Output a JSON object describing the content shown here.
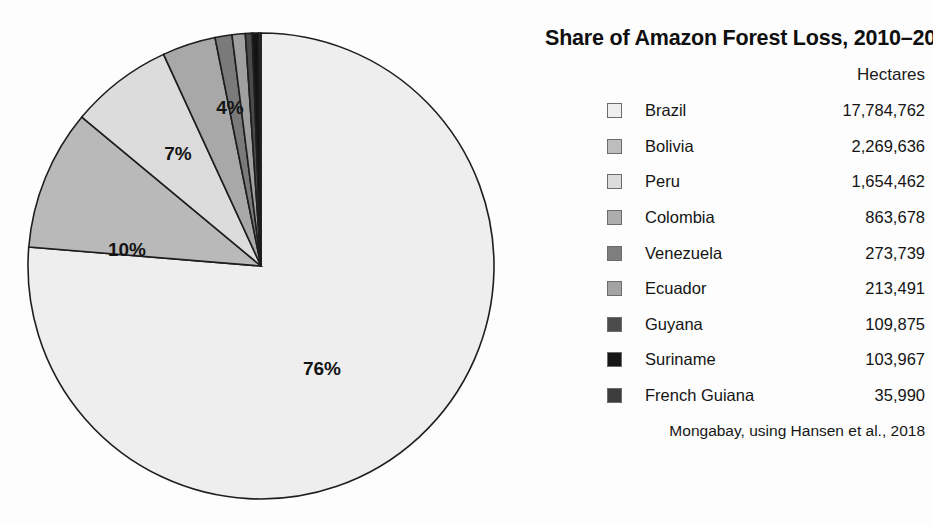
{
  "chart_data": {
    "type": "pie",
    "title": "Share of Amazon Forest Loss, 2010–2017",
    "value_header": "Hectares",
    "source": "Mongabay, using Hansen et al., 2018",
    "unit": "hectares",
    "categories": [
      "Brazil",
      "Bolivia",
      "Peru",
      "Colombia",
      "Venezuela",
      "Ecuador",
      "Guyana",
      "Suriname",
      "French Guiana"
    ],
    "values": [
      17784762,
      2269636,
      1654462,
      863678,
      273739,
      213491,
      109875,
      103967,
      35990
    ],
    "value_labels": [
      "17,784,762",
      "2,269,636",
      "1,654,462",
      "863,678",
      "273,739",
      "213,491",
      "109,875",
      "103,967",
      "35,990"
    ],
    "percentages": [
      76,
      10,
      7,
      4,
      1.2,
      0.9,
      0.5,
      0.4,
      0.2
    ],
    "shown_pct_labels": [
      "76%",
      "10%",
      "7%",
      "4%"
    ],
    "colors": [
      "#eeeeee",
      "#b9b9b9",
      "#dcdcdc",
      "#a8a8a8",
      "#7a7a7a",
      "#a0a0a0",
      "#4a4a4a",
      "#141414",
      "#3b3b3b"
    ],
    "slice_outline_color": "#1e1e1e",
    "legend_position": "right",
    "grid": false,
    "start_angle_deg": 0,
    "direction": "clockwise-for-brazil"
  },
  "pie": {
    "labels": [
      {
        "text": "76%",
        "x": 295,
        "y": 338
      },
      {
        "text": "10%",
        "x": 100,
        "y": 219
      },
      {
        "text": "7%",
        "x": 151,
        "y": 123
      },
      {
        "text": "4%",
        "x": 203,
        "y": 77
      }
    ]
  },
  "panel": {
    "title": "Share of Amazon Forest Loss, 2010–2017",
    "value_header": "Hectares",
    "source": "Mongabay, using Hansen et al., 2018",
    "rows": [
      {
        "name": "Brazil",
        "value": "17,784,762",
        "color": "#efefef"
      },
      {
        "name": "Bolivia",
        "value": "2,269,636",
        "color": "#bdbdbd"
      },
      {
        "name": "Peru",
        "value": "1,654,462",
        "color": "#dcdcdc"
      },
      {
        "name": "Colombia",
        "value": "863,678",
        "color": "#adadad"
      },
      {
        "name": "Venezuela",
        "value": "273,739",
        "color": "#7e7e7e"
      },
      {
        "name": "Ecuador",
        "value": "213,491",
        "color": "#a3a3a3"
      },
      {
        "name": "Guyana",
        "value": "109,875",
        "color": "#4c4c4c"
      },
      {
        "name": "Suriname",
        "value": "103,967",
        "color": "#161616"
      },
      {
        "name": "French Guiana",
        "value": "35,990",
        "color": "#3d3d3d"
      }
    ]
  }
}
